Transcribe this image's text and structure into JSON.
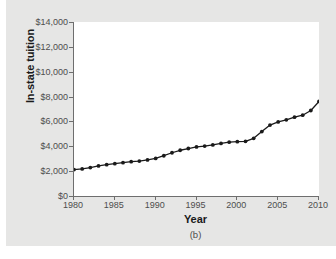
{
  "figure": {
    "caption": "(b)",
    "background_color": "#e6e6e5",
    "plot_background_color": "#ffffff",
    "axis_color": "#6e6e6e",
    "series_color": "#1a1a1a"
  },
  "chart_data": {
    "type": "line",
    "title": "",
    "subtitle": "",
    "xlabel": "Year",
    "ylabel": "In-state tuition",
    "xlim": [
      1980,
      2010
    ],
    "ylim": [
      0,
      14000
    ],
    "grid": false,
    "legend": null,
    "legend_position": "none",
    "marker": "filled-circle",
    "x_tick_labels": [
      "1980",
      "1985",
      "1990",
      "1995",
      "2000",
      "2005",
      "2010"
    ],
    "x_ticks": [
      1980,
      1985,
      1990,
      1995,
      2000,
      2005,
      2010
    ],
    "y_tick_labels": [
      "$0",
      "$2,000",
      "$4,000",
      "$6,000",
      "$8,000",
      "$10,000",
      "$12,000",
      "$14,000"
    ],
    "y_ticks": [
      0,
      2000,
      4000,
      6000,
      8000,
      10000,
      12000,
      14000
    ],
    "x": [
      1980,
      1981,
      1982,
      1983,
      1984,
      1985,
      1986,
      1987,
      1988,
      1989,
      1990,
      1991,
      1992,
      1993,
      1994,
      1995,
      1996,
      1997,
      1998,
      1999,
      2000,
      2001,
      2002,
      2003,
      2004,
      2005,
      2006,
      2007,
      2008,
      2009,
      2010
    ],
    "values": [
      2130,
      2180,
      2290,
      2420,
      2520,
      2600,
      2680,
      2760,
      2810,
      2900,
      3020,
      3240,
      3480,
      3680,
      3820,
      3950,
      4020,
      4110,
      4230,
      4330,
      4370,
      4400,
      4640,
      5180,
      5710,
      5960,
      6130,
      6340,
      6500,
      6880,
      7610
    ],
    "annotations": [
      "(b)"
    ]
  }
}
